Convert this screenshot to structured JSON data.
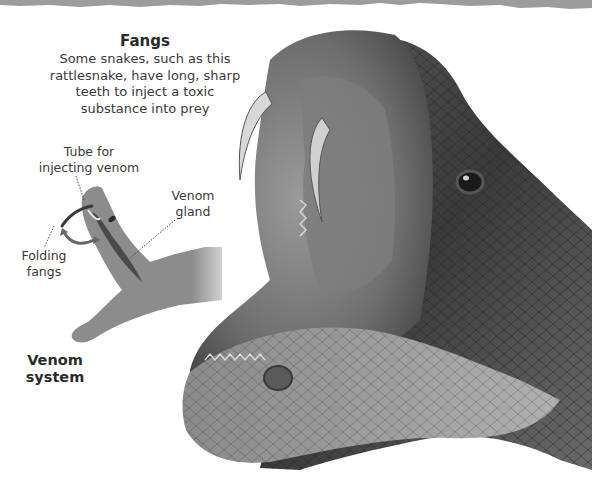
{
  "fangs": {
    "title": "Fangs",
    "description": "Some snakes, such as this rattlesnake, have long, sharp teeth to inject a toxic substance into prey",
    "lines": [
      "Some snakes, such as this",
      "rattlesnake, have long, sharp",
      "teeth to inject a toxic",
      "substance into prey"
    ]
  },
  "diagram": {
    "labels": {
      "tube": [
        "Tube for",
        "injecting venom"
      ],
      "gland": [
        "Venom",
        "gland"
      ],
      "folding": [
        "Folding",
        "fangs"
      ]
    },
    "caption": [
      "Venom",
      "system"
    ]
  },
  "illustration": {
    "subject": "rattlesnake-head-open-mouth",
    "palette": {
      "silhouette": "#8c8c8c",
      "gland": "#4a4a4a",
      "background": "#ffffff",
      "torn_edge": "#9a9a9a"
    }
  }
}
